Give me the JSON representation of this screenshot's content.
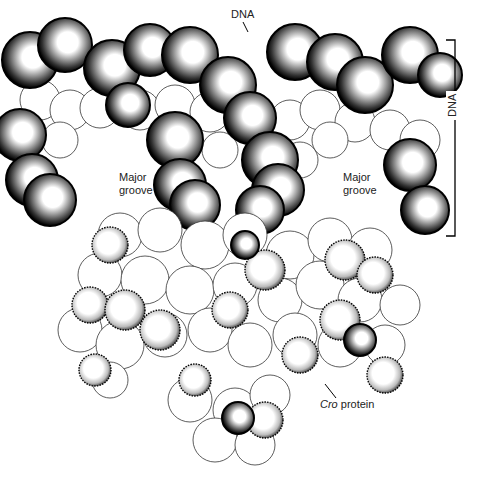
{
  "figure": {
    "labels": {
      "dna_top": "DNA",
      "dna_bracket": "DNA",
      "major_groove_left": [
        "Major",
        "groove"
      ],
      "major_groove_right": [
        "Major",
        "groove"
      ],
      "cro_italic": "Cro",
      "cro_rest": " protein"
    },
    "colors": {
      "ink": "#111111",
      "paper": "#ffffff"
    }
  }
}
